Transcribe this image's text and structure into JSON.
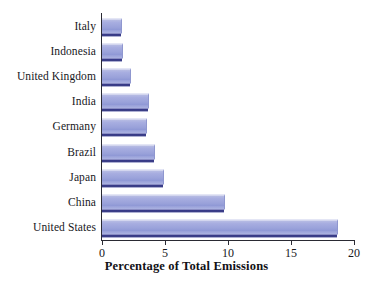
{
  "chart_data": {
    "type": "bar",
    "orientation": "horizontal",
    "title": "",
    "xlabel": "Percentage of Total Emissions",
    "ylabel": "",
    "xlim": [
      0,
      20
    ],
    "xticks": [
      0,
      5,
      10,
      15,
      20
    ],
    "xtick_labels": [
      "0",
      "5",
      "10",
      "15",
      "20"
    ],
    "grid": false,
    "legend": false,
    "bar_color": "#9aa2da",
    "bar_shadow_color": "#3c3f95",
    "axis_color": "#2a2a33",
    "categories": [
      "Italy",
      "Indonesia",
      "United Kingdom",
      "India",
      "Germany",
      "Brazil",
      "Japan",
      "China",
      "United States"
    ],
    "values": [
      1.6,
      1.7,
      2.3,
      3.7,
      3.6,
      4.2,
      4.9,
      9.8,
      18.7
    ],
    "bars": [
      {
        "label": "Italy",
        "value": 1.6
      },
      {
        "label": "Indonesia",
        "value": 1.7
      },
      {
        "label": "United Kingdom",
        "value": 2.3
      },
      {
        "label": "India",
        "value": 3.7
      },
      {
        "label": "Germany",
        "value": 3.6
      },
      {
        "label": "Brazil",
        "value": 4.2
      },
      {
        "label": "Japan",
        "value": 4.9
      },
      {
        "label": "China",
        "value": 9.8
      },
      {
        "label": "United States",
        "value": 18.7
      }
    ]
  }
}
